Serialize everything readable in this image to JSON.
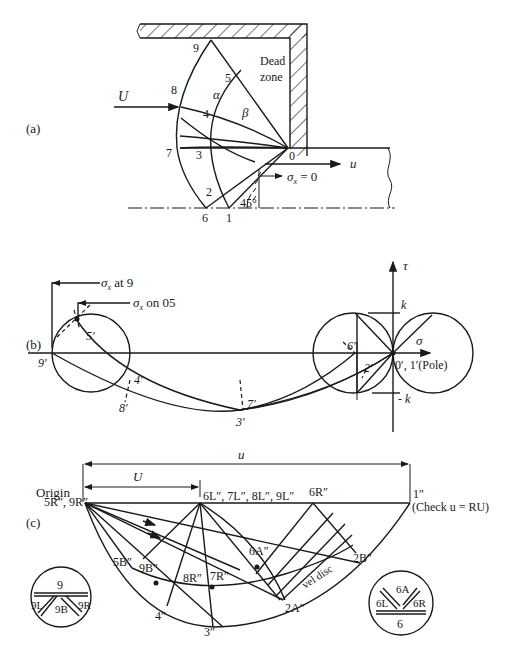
{
  "figure": {
    "panel_a": {
      "label": "(a)",
      "dead_zone_line1": "Dead",
      "dead_zone_line2": "zone",
      "incoming_velocity": "U",
      "exit_velocity": "u",
      "boundary_condition": "σx = 0",
      "boundary_sigma": "σ",
      "boundary_sub": "x",
      "boundary_rest": " = 0",
      "angle": "45°",
      "alpha": "α",
      "beta": "β",
      "points": [
        "0",
        "1",
        "2",
        "3",
        "4",
        "5",
        "6",
        "7",
        "8",
        "9"
      ]
    },
    "panel_b": {
      "label": "(b)",
      "sigma_at_9_sym": "σ",
      "sigma_at_9_sub": "x",
      "sigma_at_9_text": " at 9",
      "sigma_on_05_sym": "σ",
      "sigma_on_05_sub": "x",
      "sigma_on_05_text": " on 05",
      "tau_axis": "τ",
      "sigma_axis": "σ",
      "k_pos": "k",
      "k_neg": "- k",
      "pole_label": "0′, 1′(Pole)",
      "points": {
        "p9": "9′",
        "p5": "5′",
        "p4": "4′",
        "p8": "8′",
        "p7": "7′",
        "p3": "3′",
        "p6": "6′",
        "p2": "2′"
      }
    },
    "panel_c": {
      "label": "(c)",
      "origin": "Origin",
      "origin_pts": "5R″, 9R″",
      "u_total": "u",
      "U_segment": "U",
      "left_pts": "6L″, 7L″, 8L″, 9L″",
      "p6R": "6R″",
      "p1": "1″",
      "check": "(Check u = RU)",
      "p5B": "5B″",
      "p9B": "9B″",
      "p8R": "8R″",
      "p7R": "7R″",
      "p6A": "6A″",
      "p4": "4″",
      "p3": "3″",
      "p2A": "2A″",
      "p2B": "2B″",
      "vel_disc": "vel disc",
      "inset_9": {
        "top": "9",
        "left": "9L",
        "bottom": "9B",
        "right": "9R"
      },
      "inset_6": {
        "top": "6A",
        "left": "6L",
        "right": "6R",
        "bottom": "6"
      }
    }
  }
}
